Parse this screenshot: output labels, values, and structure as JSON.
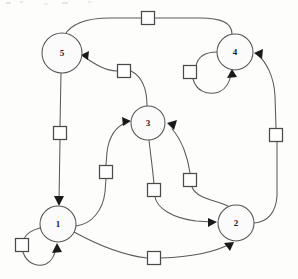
{
  "diagram": {
    "type": "petri-net",
    "canvas": {
      "width": 298,
      "height": 279,
      "background": "#fdfdfc"
    },
    "style": {
      "place_fill": "#fbfbfb",
      "place_stroke": "#555555",
      "transition_fill": "#ffffff",
      "transition_stroke": "#4a4a4a",
      "arc_stroke": "#5a5a5a",
      "arrow_fill": "#1a1a1a"
    },
    "places": [
      {
        "id": "p5",
        "label": "5",
        "cx": 62,
        "cy": 53,
        "r": 20
      },
      {
        "id": "p4",
        "label": "4",
        "cx": 235,
        "cy": 52,
        "r": 18
      },
      {
        "id": "p3",
        "label": "3",
        "cx": 148,
        "cy": 123,
        "r": 17
      },
      {
        "id": "p1",
        "label": "1",
        "cx": 58,
        "cy": 224,
        "r": 18
      },
      {
        "id": "p2",
        "label": "2",
        "cx": 236,
        "cy": 223,
        "r": 18
      }
    ],
    "transitions": [
      {
        "id": "t_top",
        "label": "",
        "cx": 148,
        "cy": 18,
        "size": 13
      },
      {
        "id": "t_3to5",
        "label": "",
        "cx": 124,
        "cy": 71,
        "size": 13
      },
      {
        "id": "t_4loop",
        "label": "",
        "cx": 190,
        "cy": 72,
        "size": 13
      },
      {
        "id": "t_5to1",
        "label": "",
        "cx": 60,
        "cy": 133,
        "size": 13
      },
      {
        "id": "t_2to4",
        "label": "",
        "cx": 276,
        "cy": 135,
        "size": 13
      },
      {
        "id": "t_1to3",
        "label": "",
        "cx": 106,
        "cy": 172,
        "size": 13
      },
      {
        "id": "t_2to3",
        "label": "",
        "cx": 190,
        "cy": 180,
        "size": 13
      },
      {
        "id": "t_3to2",
        "label": "",
        "cx": 154,
        "cy": 190,
        "size": 13
      },
      {
        "id": "t_1loop",
        "label": "",
        "cx": 22,
        "cy": 245,
        "size": 13
      },
      {
        "id": "t_1to2",
        "label": "",
        "cx": 154,
        "cy": 258,
        "size": 13
      }
    ],
    "arcs": [
      {
        "id": "a1",
        "from": "p4",
        "to": "p5",
        "via": "t_top",
        "description": "place 4 to place 5 across top"
      },
      {
        "id": "a2",
        "from": "p3",
        "to": "p5",
        "via": "t_3to5",
        "description": "place 3 to place 5"
      },
      {
        "id": "a3",
        "from": "p4",
        "to": "p4",
        "via": "t_4loop",
        "description": "place 4 self loop"
      },
      {
        "id": "a4",
        "from": "p5",
        "to": "p1",
        "via": "t_5to1",
        "description": "place 5 down to place 1"
      },
      {
        "id": "a5",
        "from": "p2",
        "to": "p4",
        "via": "t_2to4",
        "description": "place 2 up right side to place 4"
      },
      {
        "id": "a6",
        "from": "p1",
        "to": "p3",
        "via": "t_1to3",
        "description": "place 1 to place 3"
      },
      {
        "id": "a7",
        "from": "p2",
        "to": "p3",
        "via": "t_2to3",
        "description": "place 2 to place 3"
      },
      {
        "id": "a8",
        "from": "p3",
        "to": "p2",
        "via": "t_3to2",
        "description": "place 3 to place 2"
      },
      {
        "id": "a9",
        "from": "p1",
        "to": "p1",
        "via": "t_1loop",
        "description": "place 1 self loop"
      },
      {
        "id": "a10",
        "from": "p1",
        "to": "p2",
        "via": "t_1to2",
        "description": "place 1 to place 2 across bottom"
      }
    ]
  }
}
